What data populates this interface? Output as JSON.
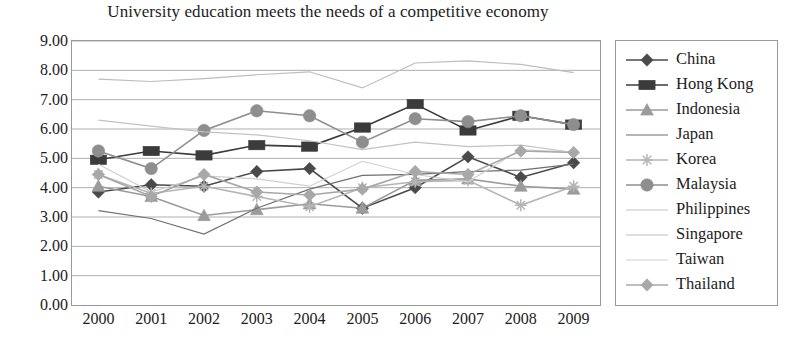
{
  "chart_data": {
    "type": "line",
    "title": "University education meets the needs of a competitive economy",
    "xlabel": "",
    "ylabel": "",
    "categories": [
      "2000",
      "2001",
      "2002",
      "2003",
      "2004",
      "2005",
      "2006",
      "2007",
      "2008",
      "2009"
    ],
    "ylim": [
      0.0,
      9.0
    ],
    "ytick_step": 1.0,
    "ytick_labels": [
      "9.00",
      "8.00",
      "7.00",
      "6.00",
      "5.00",
      "4.00",
      "3.00",
      "2.00",
      "1.00",
      "0.00"
    ],
    "ytick_values": [
      9.0,
      8.0,
      7.0,
      6.0,
      5.0,
      4.0,
      3.0,
      2.0,
      1.0,
      0.0
    ],
    "grid": "horizontal",
    "legend_position": "right",
    "series": [
      {
        "name": "China",
        "marker": "diamond",
        "color": "#4a4a4a",
        "values": [
          3.85,
          4.1,
          4.05,
          4.55,
          4.65,
          3.3,
          4.0,
          5.05,
          4.35,
          4.85
        ]
      },
      {
        "name": "Hong Kong",
        "marker": "square",
        "color": "#3b3b3b",
        "values": [
          4.95,
          5.25,
          5.1,
          5.45,
          5.4,
          6.05,
          6.85,
          5.95,
          6.45,
          6.15
        ]
      },
      {
        "name": "Indonesia",
        "marker": "triangle",
        "color": "#9b9b9b",
        "values": [
          4.05,
          3.7,
          3.05,
          3.25,
          3.45,
          3.3,
          4.25,
          4.3,
          4.05,
          3.95
        ]
      },
      {
        "name": "Japan",
        "marker": "none",
        "color": "#6f6f6f",
        "values": [
          3.22,
          2.95,
          2.42,
          3.3,
          3.95,
          4.42,
          4.45,
          4.55,
          4.6,
          4.8
        ]
      },
      {
        "name": "Korea",
        "marker": "star",
        "color": "#b5b5b5",
        "values": [
          4.45,
          3.8,
          4.05,
          3.7,
          3.35,
          4.0,
          4.2,
          4.25,
          3.4,
          4.05
        ]
      },
      {
        "name": "Malaysia",
        "marker": "circle",
        "color": "#8e8e8e",
        "values": [
          5.25,
          4.65,
          5.95,
          6.62,
          6.45,
          5.55,
          6.35,
          6.25,
          6.45,
          6.15
        ]
      },
      {
        "name": "Philippines",
        "marker": "none",
        "color": "#c2c2c2",
        "values": [
          6.3,
          6.1,
          5.9,
          5.8,
          5.6,
          5.3,
          5.55,
          5.4,
          5.45,
          5.2
        ]
      },
      {
        "name": "Singapore",
        "marker": "none",
        "color": "#bdbdbd",
        "values": [
          7.7,
          7.62,
          7.72,
          7.85,
          7.95,
          7.4,
          8.25,
          8.32,
          8.2,
          7.92
        ]
      },
      {
        "name": "Taiwan",
        "marker": "none",
        "color": "#cfcfcf",
        "values": [
          4.8,
          3.85,
          4.4,
          4.3,
          4.05,
          4.9,
          4.45,
          4.2,
          5.3,
          5.2
        ]
      },
      {
        "name": "Thailand",
        "marker": "diamond",
        "color": "#a8a8a8",
        "values": [
          4.45,
          3.7,
          4.45,
          3.85,
          3.75,
          3.95,
          4.55,
          4.45,
          5.25,
          5.2
        ]
      }
    ]
  },
  "legend": {
    "items": [
      {
        "label": "China"
      },
      {
        "label": "Hong Kong"
      },
      {
        "label": "Indonesia"
      },
      {
        "label": "Japan"
      },
      {
        "label": "Korea"
      },
      {
        "label": "Malaysia"
      },
      {
        "label": "Philippines"
      },
      {
        "label": "Singapore"
      },
      {
        "label": "Taiwan"
      },
      {
        "label": "Thailand"
      }
    ]
  }
}
